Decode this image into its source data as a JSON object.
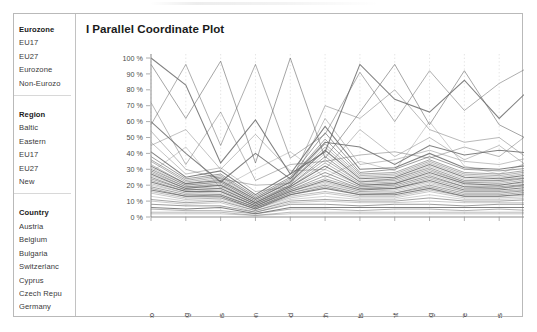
{
  "window": {
    "title": "Parallel Coordinate Plot"
  },
  "chart_title": {
    "bar": "I",
    "text": "Parallel Coordinate Plot"
  },
  "sidebar": {
    "groups": [
      {
        "name": "eurozone",
        "header": "Eurozone",
        "items": [
          "EU17",
          "EU27",
          "Eurozone",
          "Non-Eurozo"
        ]
      },
      {
        "name": "region",
        "header": "Region",
        "items": [
          "Baltic",
          "Eastern",
          "EU17",
          "EU27",
          "New"
        ]
      },
      {
        "name": "country",
        "header": "Country",
        "items": [
          "Austria",
          "Belgium",
          "Bulgaria",
          "Switzerlanc",
          "Cyprus",
          "Czech Repu",
          "Germany"
        ]
      }
    ]
  },
  "chart_data": {
    "type": "line",
    "title": "Parallel Coordinate Plot",
    "subtype": "parallel-coordinates",
    "xlabel": "",
    "ylabel": "",
    "ylim": [
      0,
      100
    ],
    "grid": true,
    "legend": false,
    "y_ticks": [
      "0 %",
      "10 %",
      "20 %",
      "30 %",
      "40 %",
      "50 %",
      "60 %",
      "70 %",
      "80 %",
      "90 %",
      "100 %"
    ],
    "y_tick_values": [
      0,
      10,
      20,
      30,
      40,
      50,
      60,
      70,
      80,
      90,
      100
    ],
    "categories": [
      "Alcohol & Tobacco",
      "Clothing",
      "Communications",
      "Education",
      "Food",
      "Health",
      "Hotels & Restaurants",
      "Household Equipment",
      "Housing",
      "Recreation & Culture",
      "Services",
      "Transport"
    ],
    "line_color": "#6b6b6b",
    "series": [
      {
        "name": "s1",
        "values": [
          100,
          83,
          34,
          61,
          27,
          41,
          96,
          74,
          66,
          86,
          62,
          83
        ]
      },
      {
        "name": "s2",
        "values": [
          96,
          62,
          98,
          34,
          100,
          37,
          66,
          96,
          58,
          92,
          58,
          47
        ]
      },
      {
        "name": "s3",
        "values": [
          58,
          96,
          45,
          96,
          37,
          52,
          91,
          60,
          92,
          67,
          84,
          96
        ]
      },
      {
        "name": "s4",
        "values": [
          54,
          30,
          24,
          20,
          21,
          70,
          62,
          80,
          55,
          47,
          50,
          34
        ]
      },
      {
        "name": "s5",
        "values": [
          47,
          27,
          31,
          16,
          19,
          62,
          33,
          36,
          42,
          35,
          33,
          38
        ]
      },
      {
        "name": "s6",
        "values": [
          41,
          25,
          29,
          14,
          27,
          57,
          30,
          31,
          40,
          31,
          30,
          33
        ]
      },
      {
        "name": "s7",
        "values": [
          38,
          24,
          27,
          13,
          25,
          53,
          28,
          30,
          38,
          30,
          29,
          31
        ]
      },
      {
        "name": "s8",
        "values": [
          36,
          23,
          26,
          12,
          24,
          49,
          27,
          28,
          36,
          28,
          27,
          30
        ]
      },
      {
        "name": "s9",
        "values": [
          35,
          22,
          25,
          12,
          23,
          46,
          26,
          27,
          35,
          27,
          26,
          29
        ]
      },
      {
        "name": "s10",
        "values": [
          33,
          21,
          24,
          11,
          22,
          44,
          25,
          26,
          34,
          26,
          25,
          28
        ]
      },
      {
        "name": "s11",
        "values": [
          32,
          21,
          23,
          11,
          22,
          42,
          24,
          25,
          33,
          25,
          24,
          27
        ]
      },
      {
        "name": "s12",
        "values": [
          31,
          20,
          22,
          10,
          21,
          40,
          23,
          24,
          32,
          24,
          23,
          26
        ]
      },
      {
        "name": "s13",
        "values": [
          30,
          20,
          22,
          10,
          20,
          38,
          22,
          24,
          31,
          23,
          23,
          25
        ]
      },
      {
        "name": "s14",
        "values": [
          29,
          19,
          21,
          9,
          20,
          36,
          22,
          23,
          30,
          22,
          22,
          25
        ]
      },
      {
        "name": "s15",
        "values": [
          28,
          19,
          20,
          9,
          19,
          34,
          21,
          22,
          29,
          22,
          21,
          24
        ]
      },
      {
        "name": "s16",
        "values": [
          27,
          18,
          20,
          9,
          19,
          32,
          20,
          21,
          28,
          21,
          20,
          23
        ]
      },
      {
        "name": "s17",
        "values": [
          26,
          18,
          19,
          8,
          18,
          30,
          20,
          21,
          27,
          20,
          20,
          22
        ]
      },
      {
        "name": "s18",
        "values": [
          25,
          17,
          18,
          8,
          18,
          28,
          19,
          20,
          26,
          19,
          19,
          21
        ]
      },
      {
        "name": "s19",
        "values": [
          24,
          17,
          18,
          8,
          17,
          26,
          18,
          19,
          25,
          19,
          18,
          21
        ]
      },
      {
        "name": "s20",
        "values": [
          23,
          16,
          17,
          7,
          17,
          24,
          18,
          18,
          24,
          18,
          18,
          20
        ]
      },
      {
        "name": "s21",
        "values": [
          22,
          16,
          16,
          7,
          16,
          23,
          17,
          18,
          23,
          17,
          17,
          19
        ]
      },
      {
        "name": "s22",
        "values": [
          21,
          15,
          16,
          7,
          16,
          22,
          16,
          17,
          22,
          16,
          16,
          18
        ]
      },
      {
        "name": "s23",
        "values": [
          20,
          15,
          15,
          6,
          15,
          21,
          16,
          16,
          21,
          16,
          16,
          17
        ]
      },
      {
        "name": "s24",
        "values": [
          19,
          14,
          14,
          6,
          15,
          20,
          15,
          15,
          20,
          15,
          15,
          17
        ]
      },
      {
        "name": "s25",
        "values": [
          18,
          13,
          14,
          6,
          14,
          19,
          14,
          15,
          19,
          14,
          14,
          16
        ]
      },
      {
        "name": "s26",
        "values": [
          17,
          13,
          13,
          5,
          14,
          18,
          14,
          14,
          18,
          13,
          13,
          15
        ]
      },
      {
        "name": "s27",
        "values": [
          16,
          12,
          12,
          5,
          13,
          16,
          13,
          13,
          17,
          13,
          13,
          14
        ]
      },
      {
        "name": "s28",
        "values": [
          15,
          11,
          12,
          5,
          12,
          15,
          12,
          12,
          16,
          12,
          12,
          13
        ]
      },
      {
        "name": "s29",
        "values": [
          13,
          10,
          11,
          4,
          11,
          13,
          11,
          11,
          14,
          11,
          11,
          12
        ]
      },
      {
        "name": "s30",
        "values": [
          11,
          9,
          10,
          4,
          10,
          11,
          10,
          10,
          12,
          10,
          10,
          11
        ]
      },
      {
        "name": "s31",
        "values": [
          60,
          40,
          22,
          40,
          24,
          47,
          44,
          33,
          45,
          39,
          42,
          40
        ]
      },
      {
        "name": "s32",
        "values": [
          72,
          33,
          66,
          23,
          33,
          35,
          39,
          41,
          37,
          44,
          38,
          55
        ]
      },
      {
        "name": "s33",
        "values": [
          45,
          55,
          30,
          52,
          29,
          30,
          55,
          38,
          50,
          36,
          45,
          29
        ]
      },
      {
        "name": "s34",
        "values": [
          10,
          8,
          9,
          3,
          9,
          10,
          9,
          9,
          10,
          9,
          9,
          9
        ]
      },
      {
        "name": "s35",
        "values": [
          8,
          7,
          7,
          3,
          8,
          8,
          7,
          8,
          8,
          7,
          8,
          8
        ]
      },
      {
        "name": "s36",
        "values": [
          6,
          5,
          6,
          2,
          6,
          6,
          6,
          6,
          6,
          6,
          6,
          6
        ]
      },
      {
        "name": "s37",
        "values": [
          5,
          4,
          4,
          2,
          5,
          5,
          4,
          5,
          5,
          4,
          5,
          4
        ]
      },
      {
        "name": "s38",
        "values": [
          3,
          3,
          3,
          1,
          3,
          3,
          3,
          3,
          3,
          3,
          3,
          3
        ]
      },
      {
        "name": "s39",
        "values": [
          2,
          2,
          2,
          1,
          2,
          2,
          2,
          2,
          2,
          2,
          2,
          2
        ]
      },
      {
        "name": "s40",
        "values": [
          28,
          44,
          18,
          30,
          41,
          25,
          35,
          29,
          60,
          32,
          27,
          36
        ]
      }
    ]
  }
}
